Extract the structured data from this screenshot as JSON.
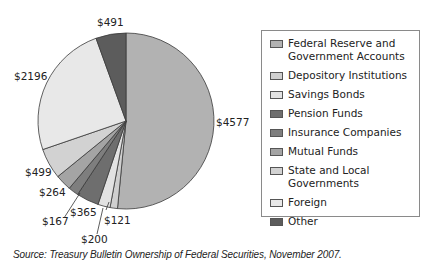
{
  "chart_data": {
    "type": "pie",
    "title": "",
    "units": "$ (billions)",
    "start_angle": "12 o'clock",
    "direction": "clockwise",
    "categories": [
      "Federal Reserve and Government Accounts",
      "Depository Institutions",
      "Savings Bonds",
      "Pension Funds",
      "Insurance Companies",
      "Mutual Funds",
      "State and Local Governments",
      "Foreign",
      "Other"
    ],
    "values": [
      4577,
      121,
      200,
      365,
      167,
      264,
      499,
      2196,
      491
    ],
    "data_labels": [
      "$4577",
      "$121",
      "$200",
      "$365",
      "$167",
      "$264",
      "$499",
      "$2196",
      "$491"
    ],
    "colors": [
      "#b2b2b2",
      "#cfcfcf",
      "#e2e2e2",
      "#6e6e6e",
      "#7e7e7e",
      "#a4a4a4",
      "#d2d2d2",
      "#e8e8e8",
      "#5c5c5c"
    ],
    "legend_position": "right",
    "grid": false
  },
  "legend": {
    "items": [
      {
        "label": "Federal Reserve and\nGovernment Accounts",
        "color": "#b2b2b2"
      },
      {
        "label": "Depository Institutions",
        "color": "#cfcfcf"
      },
      {
        "label": "Savings Bonds",
        "color": "#e2e2e2"
      },
      {
        "label": "Pension Funds",
        "color": "#6e6e6e"
      },
      {
        "label": "Insurance Companies",
        "color": "#7e7e7e"
      },
      {
        "label": "Mutual Funds",
        "color": "#a4a4a4"
      },
      {
        "label": "State and Local Governments",
        "color": "#d2d2d2"
      },
      {
        "label": "Foreign",
        "color": "#e8e8e8"
      },
      {
        "label": "Other",
        "color": "#5c5c5c"
      }
    ]
  },
  "labels": {
    "federal": "$4577",
    "depository": "$121",
    "savings": "$200",
    "pension": "$365",
    "insurance": "$167",
    "mutual": "$264",
    "state": "$499",
    "foreign": "$2196",
    "other": "$491"
  },
  "source": "Source: Treasury Bulletin Ownership of Federal Securities, November 2007."
}
